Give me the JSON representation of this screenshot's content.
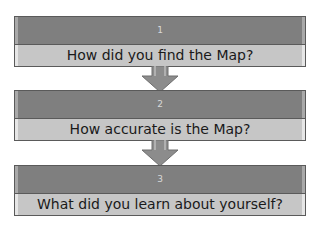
{
  "diagram": {
    "type": "vertical-process-flow",
    "steps": [
      {
        "number": "1",
        "text": "How did you find the Map?"
      },
      {
        "number": "2",
        "text": "How accurate is the Map?"
      },
      {
        "number": "3",
        "text": "What did you learn about yourself?"
      }
    ],
    "colors": {
      "header_fill": "#7f7f7f",
      "body_fill": "#c6c6c6",
      "arrow_fill": "#8c8c8c",
      "border": "#5a5a5a"
    }
  }
}
